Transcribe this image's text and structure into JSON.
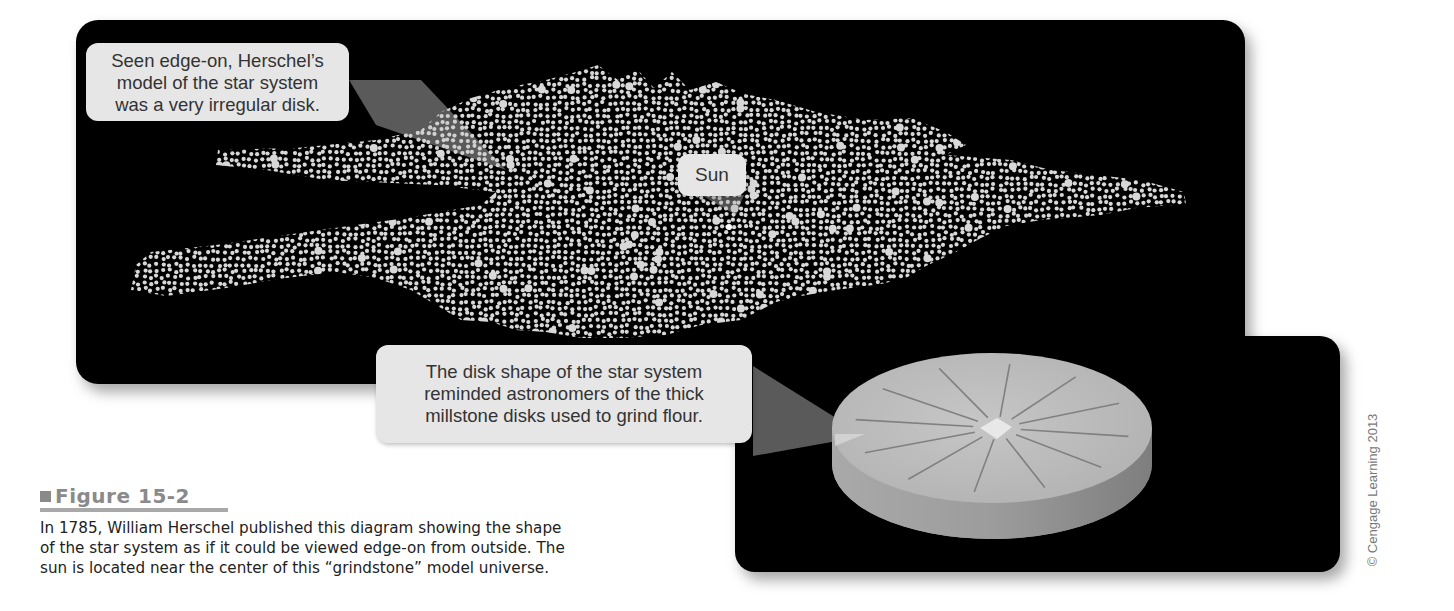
{
  "figure": {
    "label": "Figure 15-2",
    "caption_lines": [
      "In 1785, William Herschel published this diagram showing the shape",
      "of the star system as if it could be viewed edge-on from outside. The",
      "sun is located near the center of this “grindstone” model universe."
    ],
    "credit": "© Cengage Learning 2013"
  },
  "top_panel": {
    "subject": "Herschel star system model (edge-on)",
    "callouts": {
      "herschel": {
        "lines": [
          "Seen edge-on, Herschel’s",
          "model of the star system",
          "was a very irregular disk."
        ]
      },
      "sun": {
        "label": "Sun"
      }
    }
  },
  "bottom_panel": {
    "subject": "Millstone disk",
    "callout": {
      "lines": [
        "The disk shape of the star system",
        "reminded astronomers of the thick",
        "millstone disks used to grind flour."
      ]
    }
  },
  "colors": {
    "panel_bg": "#000000",
    "star": "#d8d8d8",
    "callout_bg": "#e6e6e6",
    "millstone_top": "#bdbdbd",
    "millstone_side": "#9a9a9a",
    "figure_label": "#8a8a8a"
  }
}
